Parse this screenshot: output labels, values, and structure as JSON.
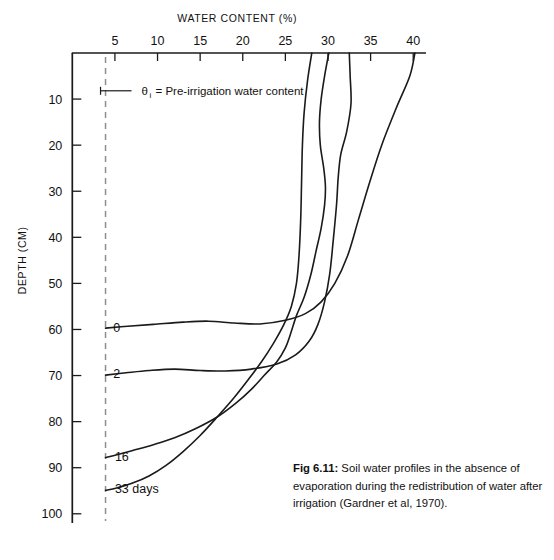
{
  "figure": {
    "caption_label": "Fig 6.11:",
    "caption_text": " Soil water profiles in the absence of evaporation during the redistribution of water after irrigation (Gardner et al, 1970)."
  },
  "legend": {
    "symbol": "θ",
    "subscript": "i",
    "text": "= Pre-irrigation water content"
  },
  "chart_data": {
    "type": "line",
    "title": "",
    "xlabel": "WATER CONTENT (%)",
    "ylabel": "DEPTH (CM)",
    "xlim": [
      0,
      41.5
    ],
    "ylim": [
      0,
      102
    ],
    "y_inverted": true,
    "grid": false,
    "legend_position": "inline-curve-labels",
    "xticks": [
      5,
      10,
      15,
      20,
      25,
      30,
      35,
      40
    ],
    "xtick_labels": [
      "5",
      "10",
      "15",
      "20",
      "25",
      "30",
      "35",
      "40"
    ],
    "yticks": [
      10,
      20,
      30,
      40,
      50,
      60,
      70,
      80,
      90,
      100
    ],
    "ytick_labels": [
      "10",
      "20",
      "30",
      "40",
      "50",
      "60",
      "70",
      "80",
      "90",
      "100"
    ],
    "reference_lines": [
      {
        "name": "pre-irrigation-water-content",
        "orientation": "vertical",
        "x": 3.9,
        "style": "dashed",
        "color": "#8d8d8d"
      }
    ],
    "series": [
      {
        "name": "0",
        "label": "0",
        "label_point": {
          "x": 4.8,
          "y": 60.5
        },
        "points": [
          {
            "x": 40.2,
            "y": 0
          },
          {
            "x": 39.6,
            "y": 5
          },
          {
            "x": 38.0,
            "y": 12
          },
          {
            "x": 36.3,
            "y": 20
          },
          {
            "x": 34.9,
            "y": 28
          },
          {
            "x": 33.6,
            "y": 36
          },
          {
            "x": 32.3,
            "y": 44
          },
          {
            "x": 30.8,
            "y": 50
          },
          {
            "x": 29.2,
            "y": 54
          },
          {
            "x": 27.4,
            "y": 56.5
          },
          {
            "x": 25.0,
            "y": 58.0
          },
          {
            "x": 22.0,
            "y": 58.8
          },
          {
            "x": 19.0,
            "y": 58.6
          },
          {
            "x": 16.0,
            "y": 58.2
          },
          {
            "x": 13.0,
            "y": 58.4
          },
          {
            "x": 9.5,
            "y": 58.9
          },
          {
            "x": 6.5,
            "y": 59.3
          },
          {
            "x": 3.9,
            "y": 59.7
          }
        ]
      },
      {
        "name": "2",
        "label": "2",
        "label_point": {
          "x": 4.8,
          "y": 70.5
        },
        "points": [
          {
            "x": 32.5,
            "y": 0
          },
          {
            "x": 32.6,
            "y": 5
          },
          {
            "x": 32.7,
            "y": 11
          },
          {
            "x": 32.2,
            "y": 17
          },
          {
            "x": 31.5,
            "y": 22
          },
          {
            "x": 31.2,
            "y": 27
          },
          {
            "x": 31.0,
            "y": 33
          },
          {
            "x": 30.6,
            "y": 41
          },
          {
            "x": 30.2,
            "y": 48
          },
          {
            "x": 29.6,
            "y": 54
          },
          {
            "x": 28.8,
            "y": 59
          },
          {
            "x": 27.8,
            "y": 62.5
          },
          {
            "x": 26.2,
            "y": 65.5
          },
          {
            "x": 24.0,
            "y": 67.5
          },
          {
            "x": 21.0,
            "y": 68.6
          },
          {
            "x": 18.0,
            "y": 69.0
          },
          {
            "x": 15.0,
            "y": 68.9
          },
          {
            "x": 12.0,
            "y": 68.6
          },
          {
            "x": 9.0,
            "y": 68.9
          },
          {
            "x": 6.3,
            "y": 69.4
          },
          {
            "x": 3.9,
            "y": 69.9
          }
        ]
      },
      {
        "name": "16",
        "label": "16",
        "label_point": {
          "x": 5.0,
          "y": 88.5
        },
        "points": [
          {
            "x": 30.1,
            "y": 0
          },
          {
            "x": 29.6,
            "y": 5
          },
          {
            "x": 29.2,
            "y": 10
          },
          {
            "x": 29.0,
            "y": 15
          },
          {
            "x": 29.1,
            "y": 20
          },
          {
            "x": 29.5,
            "y": 25
          },
          {
            "x": 29.7,
            "y": 29
          },
          {
            "x": 29.6,
            "y": 33
          },
          {
            "x": 29.2,
            "y": 38
          },
          {
            "x": 28.6,
            "y": 43
          },
          {
            "x": 28.0,
            "y": 48
          },
          {
            "x": 27.2,
            "y": 53
          },
          {
            "x": 26.3,
            "y": 57
          },
          {
            "x": 25.6,
            "y": 61
          },
          {
            "x": 25.0,
            "y": 64
          },
          {
            "x": 24.0,
            "y": 67
          },
          {
            "x": 22.5,
            "y": 70
          },
          {
            "x": 21.0,
            "y": 73
          },
          {
            "x": 19.2,
            "y": 76
          },
          {
            "x": 17.0,
            "y": 79
          },
          {
            "x": 14.5,
            "y": 81.5
          },
          {
            "x": 12.0,
            "y": 83.5
          },
          {
            "x": 9.5,
            "y": 85.0
          },
          {
            "x": 7.0,
            "y": 86.3
          },
          {
            "x": 4.8,
            "y": 87.4
          },
          {
            "x": 3.9,
            "y": 87.8
          }
        ]
      },
      {
        "name": "33 days",
        "label": "33 days",
        "label_point": {
          "x": 5.0,
          "y": 95.5
        },
        "points": [
          {
            "x": 28.1,
            "y": 0
          },
          {
            "x": 27.6,
            "y": 6
          },
          {
            "x": 27.2,
            "y": 13
          },
          {
            "x": 27.0,
            "y": 20
          },
          {
            "x": 26.9,
            "y": 28
          },
          {
            "x": 26.8,
            "y": 36
          },
          {
            "x": 26.6,
            "y": 44
          },
          {
            "x": 26.3,
            "y": 50
          },
          {
            "x": 25.7,
            "y": 55
          },
          {
            "x": 24.8,
            "y": 59
          },
          {
            "x": 23.6,
            "y": 63
          },
          {
            "x": 22.2,
            "y": 67
          },
          {
            "x": 20.6,
            "y": 71
          },
          {
            "x": 18.9,
            "y": 75
          },
          {
            "x": 17.0,
            "y": 79
          },
          {
            "x": 15.0,
            "y": 83
          },
          {
            "x": 13.0,
            "y": 86.5
          },
          {
            "x": 11.0,
            "y": 89.5
          },
          {
            "x": 9.0,
            "y": 91.8
          },
          {
            "x": 7.0,
            "y": 93.4
          },
          {
            "x": 5.2,
            "y": 94.4
          },
          {
            "x": 3.9,
            "y": 94.9
          }
        ]
      }
    ]
  }
}
